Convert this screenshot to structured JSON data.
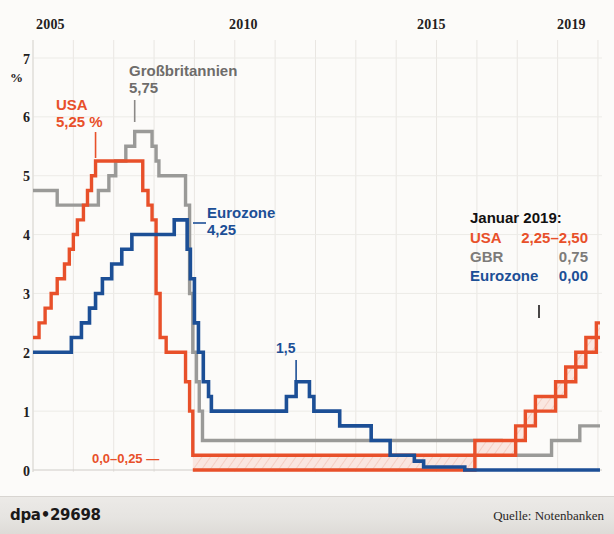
{
  "footer": {
    "credit": "dpa•29698",
    "source": "Quelle: Notenbanken"
  },
  "annotations": {
    "usa_l1": "USA",
    "usa_l2": "5,25 %",
    "gbr_l1": "Großbritannien",
    "gbr_l2": "5,75",
    "euro_l1": "Eurozone",
    "euro_l2": "4,25",
    "euro_peak": "1,5",
    "usa_floor": "0,0–0,25 —"
  },
  "legend": {
    "title": "Januar 2019:",
    "rows": [
      {
        "name": "USA",
        "value": "2,25–2,50"
      },
      {
        "name": "GBR",
        "value": "0,75"
      },
      {
        "name": "Eurozone",
        "value": "0,00"
      }
    ]
  },
  "colors": {
    "usa": "#e8502a",
    "gbr": "#9a9a98",
    "eurozone": "#1c4f96",
    "background": "#fcfbf9",
    "grid": "#e7e4e0",
    "axis_text": "#222020",
    "footer_bg": "#e6e4e1"
  },
  "chart_data": {
    "type": "line",
    "title": "",
    "subtitle": "",
    "xlabel": "",
    "ylabel": "%",
    "xlim": [
      2005.0,
      2019.1
    ],
    "ylim": [
      0,
      7
    ],
    "yticks": [
      0,
      1,
      2,
      3,
      4,
      5,
      6,
      7
    ],
    "ytick_labels": [
      "0",
      "1",
      "2",
      "3",
      "4",
      "5",
      "6",
      "7"
    ],
    "xticks": [
      2005,
      2010,
      2015,
      2019
    ],
    "xtick_labels": [
      "2005",
      "2010",
      "2015",
      "2019"
    ],
    "grid": "both-faint",
    "legend_position": "inside-right",
    "step_style": "post",
    "series": [
      {
        "name": "USA",
        "color": "#e8502a",
        "band": true,
        "note": "Fed funds target; upper bound drawn as main line, lower bound as band floor",
        "points_upper": [
          [
            2005.0,
            2.25
          ],
          [
            2005.15,
            2.5
          ],
          [
            2005.3,
            2.75
          ],
          [
            2005.45,
            3.0
          ],
          [
            2005.6,
            3.25
          ],
          [
            2005.78,
            3.5
          ],
          [
            2005.9,
            3.75
          ],
          [
            2006.0,
            4.0
          ],
          [
            2006.1,
            4.25
          ],
          [
            2006.25,
            4.5
          ],
          [
            2006.35,
            4.75
          ],
          [
            2006.45,
            5.0
          ],
          [
            2006.55,
            5.25
          ],
          [
            2007.62,
            5.25
          ],
          [
            2007.72,
            4.75
          ],
          [
            2007.85,
            4.5
          ],
          [
            2007.95,
            4.25
          ],
          [
            2008.05,
            3.0
          ],
          [
            2008.15,
            2.25
          ],
          [
            2008.3,
            2.0
          ],
          [
            2008.62,
            2.0
          ],
          [
            2008.78,
            1.5
          ],
          [
            2008.88,
            1.0
          ],
          [
            2008.96,
            0.25
          ],
          [
            2015.95,
            0.5
          ],
          [
            2016.96,
            0.75
          ],
          [
            2017.2,
            1.0
          ],
          [
            2017.45,
            1.25
          ],
          [
            2017.95,
            1.5
          ],
          [
            2018.2,
            1.75
          ],
          [
            2018.45,
            2.0
          ],
          [
            2018.7,
            2.25
          ],
          [
            2018.96,
            2.5
          ],
          [
            2019.05,
            2.5
          ]
        ],
        "points_lower": [
          [
            2008.96,
            0.0
          ],
          [
            2015.95,
            0.25
          ],
          [
            2016.96,
            0.5
          ],
          [
            2017.2,
            0.75
          ],
          [
            2017.45,
            1.0
          ],
          [
            2017.95,
            1.25
          ],
          [
            2018.2,
            1.5
          ],
          [
            2018.45,
            1.75
          ],
          [
            2018.7,
            2.0
          ],
          [
            2018.96,
            2.25
          ],
          [
            2019.05,
            2.25
          ]
        ]
      },
      {
        "name": "GBR",
        "color": "#9a9a98",
        "band": false,
        "points": [
          [
            2005.0,
            4.75
          ],
          [
            2005.6,
            4.5
          ],
          [
            2006.62,
            4.75
          ],
          [
            2006.88,
            5.0
          ],
          [
            2007.05,
            5.25
          ],
          [
            2007.3,
            5.5
          ],
          [
            2007.52,
            5.75
          ],
          [
            2007.95,
            5.5
          ],
          [
            2008.05,
            5.25
          ],
          [
            2008.12,
            5.0
          ],
          [
            2008.3,
            5.0
          ],
          [
            2008.78,
            4.5
          ],
          [
            2008.88,
            3.0
          ],
          [
            2008.96,
            2.0
          ],
          [
            2009.05,
            1.5
          ],
          [
            2009.12,
            1.0
          ],
          [
            2009.2,
            0.5
          ],
          [
            2016.6,
            0.25
          ],
          [
            2017.85,
            0.5
          ],
          [
            2018.55,
            0.75
          ],
          [
            2019.05,
            0.75
          ]
        ]
      },
      {
        "name": "Eurozone",
        "color": "#1c4f96",
        "band": false,
        "points": [
          [
            2005.0,
            2.0
          ],
          [
            2005.95,
            2.25
          ],
          [
            2006.2,
            2.5
          ],
          [
            2006.4,
            2.75
          ],
          [
            2006.55,
            3.0
          ],
          [
            2006.72,
            3.25
          ],
          [
            2006.95,
            3.5
          ],
          [
            2007.2,
            3.75
          ],
          [
            2007.45,
            4.0
          ],
          [
            2008.5,
            4.25
          ],
          [
            2008.82,
            3.75
          ],
          [
            2008.9,
            3.25
          ],
          [
            2009.0,
            2.5
          ],
          [
            2009.1,
            2.0
          ],
          [
            2009.22,
            1.5
          ],
          [
            2009.35,
            1.25
          ],
          [
            2009.42,
            1.0
          ],
          [
            2011.28,
            1.25
          ],
          [
            2011.52,
            1.5
          ],
          [
            2011.85,
            1.25
          ],
          [
            2011.96,
            1.0
          ],
          [
            2012.6,
            0.75
          ],
          [
            2013.38,
            0.5
          ],
          [
            2013.85,
            0.25
          ],
          [
            2014.45,
            0.15
          ],
          [
            2014.68,
            0.05
          ],
          [
            2015.7,
            0.0
          ],
          [
            2016.2,
            0.0
          ],
          [
            2019.05,
            0.0
          ]
        ]
      }
    ]
  }
}
